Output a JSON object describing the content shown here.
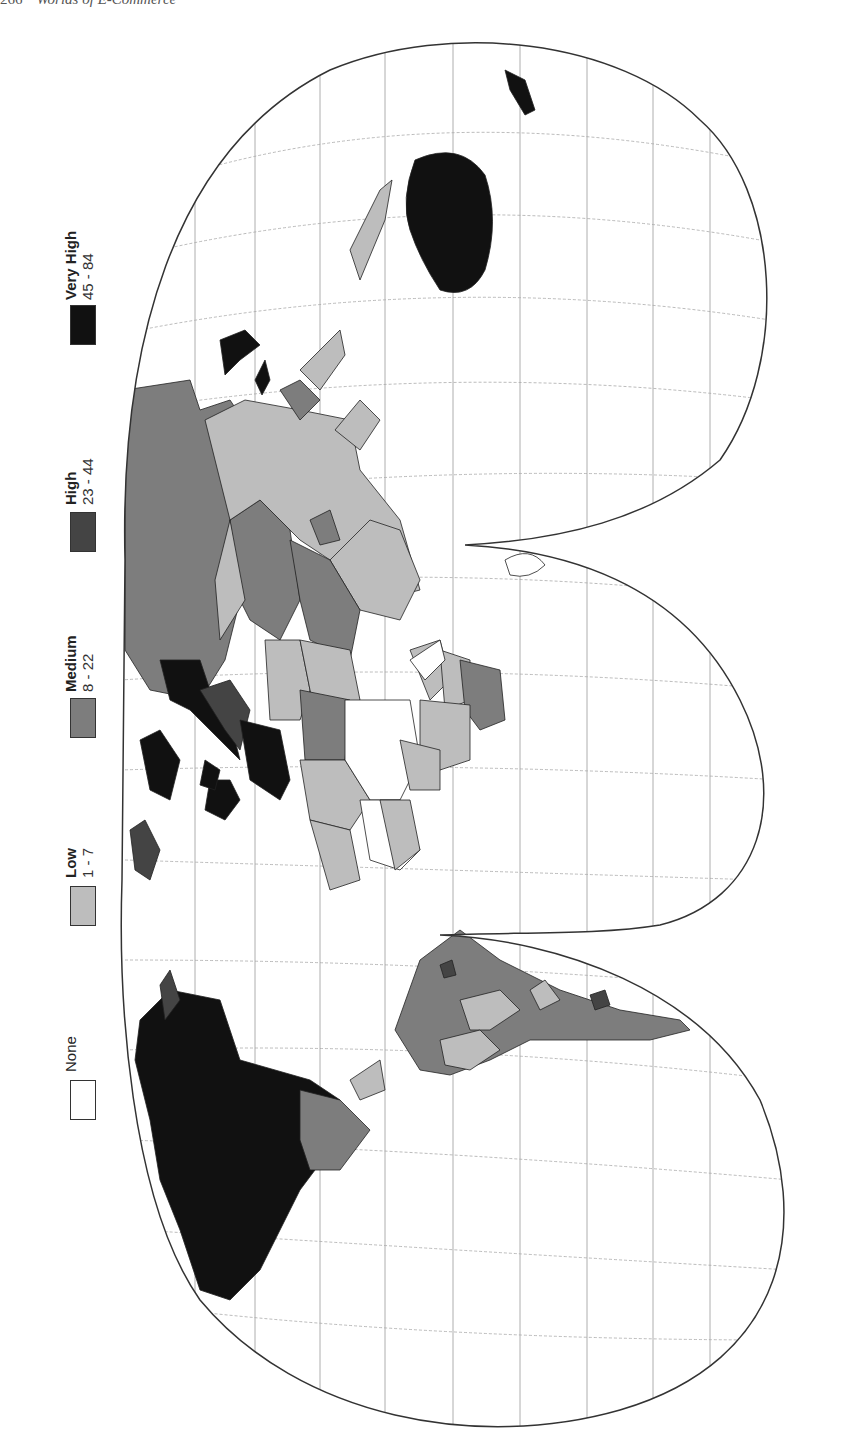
{
  "page": {
    "page_number": "266",
    "running_head": "Worlds of E-Commerce"
  },
  "legend": {
    "items": [
      {
        "category": "Very High",
        "range": "45 - 84",
        "color": "#111111"
      },
      {
        "category": "High",
        "range": "23 - 44",
        "color": "#444444"
      },
      {
        "category": "Medium",
        "range": "8 - 22",
        "color": "#7d7d7d"
      },
      {
        "category": "Low",
        "range": "1 - 7",
        "color": "#bdbdbd"
      },
      {
        "category": "None",
        "range": "",
        "color": "#ffffff"
      }
    ]
  },
  "map": {
    "projection": "interrupted world map, rotated 90° (north to the left)",
    "orientation": "portrait",
    "regions": [
      {
        "name": "North America (USA/Canada)",
        "class": "Very High"
      },
      {
        "name": "Mexico",
        "class": "Medium"
      },
      {
        "name": "South America (most)",
        "class": "Medium"
      },
      {
        "name": "Europe (western/northern)",
        "class": "Very High"
      },
      {
        "name": "Russia",
        "class": "Medium"
      },
      {
        "name": "China",
        "class": "Low"
      },
      {
        "name": "Australia",
        "class": "Very High"
      },
      {
        "name": "Africa (most)",
        "class": "None/Low"
      },
      {
        "name": "Japan/Korea",
        "class": "Very High"
      }
    ]
  }
}
